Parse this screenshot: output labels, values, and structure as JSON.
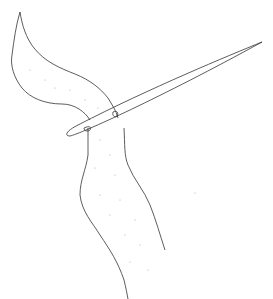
{
  "image": {
    "description": "Line drawing of a fuzzy worm-like strand of yarn threaded through the eye of a long sewing needle",
    "background": "#ffffff",
    "stroke_color": "#333333",
    "dot_color": "#aaaaaa"
  }
}
